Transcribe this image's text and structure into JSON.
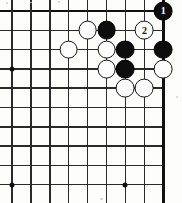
{
  "figure": {
    "kind": "go-board-diagram",
    "board": {
      "columns": 9,
      "rows": 10,
      "origin_x": 12,
      "origin_y": 11,
      "spacing_x": 18.9,
      "spacing_y": 19.3,
      "line_color": "#2a2a2a",
      "edge_color": "#111111",
      "background_color": "#fdfdfb",
      "edges": [
        "top",
        "right"
      ]
    },
    "star_points": [
      {
        "col": 0,
        "row": 3
      },
      {
        "col": 0,
        "row": 9
      },
      {
        "col": 6,
        "row": 9
      }
    ],
    "stone_radius": 9.4,
    "stones": [
      {
        "col": 4,
        "row": 1,
        "color": "white",
        "label": ""
      },
      {
        "col": 5,
        "row": 1,
        "color": "black",
        "label": ""
      },
      {
        "col": 7,
        "row": 1,
        "color": "white",
        "label": "2"
      },
      {
        "col": 8,
        "row": 0,
        "color": "black",
        "label": "1"
      },
      {
        "col": 3,
        "row": 2,
        "color": "white",
        "label": ""
      },
      {
        "col": 5,
        "row": 2,
        "color": "white",
        "label": ""
      },
      {
        "col": 6,
        "row": 2,
        "color": "black",
        "label": ""
      },
      {
        "col": 8,
        "row": 2,
        "color": "black",
        "label": ""
      },
      {
        "col": 5,
        "row": 3,
        "color": "white",
        "label": ""
      },
      {
        "col": 6,
        "row": 3,
        "color": "black",
        "label": ""
      },
      {
        "col": 8,
        "row": 3,
        "color": "white",
        "label": ""
      },
      {
        "col": 6,
        "row": 4,
        "color": "white",
        "label": ""
      },
      {
        "col": 7,
        "row": 4,
        "color": "white",
        "label": ""
      }
    ],
    "move_markers": [
      {
        "number": "1",
        "color": "black"
      },
      {
        "number": "2",
        "color": "white"
      }
    ]
  }
}
